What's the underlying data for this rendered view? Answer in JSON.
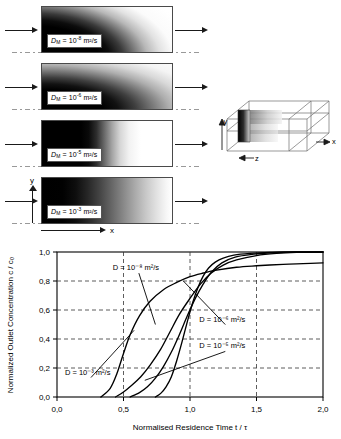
{
  "figure": {
    "panels": [
      {
        "id": "panel-d8",
        "symbol": "D",
        "subscript": "M",
        "equals": "=",
        "mantissa": "10",
        "exponent": "-8",
        "units": "m²/s",
        "label_text": "D_M = 10^-8 m²/s",
        "diffusion_coefficient": 1e-08,
        "pattern": "curved-parabolic-front"
      },
      {
        "id": "panel-d6",
        "symbol": "D",
        "subscript": "M",
        "equals": "=",
        "mantissa": "10",
        "exponent": "-6",
        "units": "m²/s",
        "label_text": "D_M = 10^-6 m²/s",
        "diffusion_coefficient": 1e-06,
        "pattern": "broad-curved-front"
      },
      {
        "id": "panel-d5",
        "symbol": "D",
        "subscript": "M",
        "equals": "=",
        "mantissa": "10",
        "exponent": "-5",
        "units": "m²/s",
        "label_text": "D_M = 10^-5 m²/s",
        "diffusion_coefficient": 1e-05,
        "pattern": "sharp-vertical-front"
      },
      {
        "id": "panel-d3",
        "symbol": "D",
        "subscript": "M",
        "equals": "=",
        "mantissa": "10",
        "exponent": "-3",
        "units": "m²/s",
        "label_text": "D_M = 10^-3 m²/s",
        "diffusion_coefficient": 0.001,
        "pattern": "smooth-linear-gradient"
      }
    ],
    "axis_labels": {
      "y": "y",
      "x": "x"
    },
    "duct": {
      "axis_x": "x",
      "axis_y": "y",
      "axis_z": "z"
    }
  },
  "chart_data": {
    "type": "line",
    "title": "",
    "xlabel": "Normalised Residence Time t / τ",
    "ylabel": "Normalized Outlet Concentration c / c₀",
    "xlim": [
      0.0,
      2.0
    ],
    "ylim": [
      0.0,
      1.0
    ],
    "xticks": [
      0.0,
      0.5,
      1.0,
      1.5,
      2.0
    ],
    "xticklabels": [
      "0,0",
      "0,5",
      "1,0",
      "1,5",
      "2,0"
    ],
    "yticks": [
      0.0,
      0.2,
      0.4,
      0.6,
      0.8,
      1.0
    ],
    "yticklabels": [
      "0,0",
      "0,2",
      "0,4",
      "0,6",
      "0,8",
      "1,0"
    ],
    "grid": "dashed-both",
    "legend": "inline-annotations",
    "series": [
      {
        "name": "D = 10^-3 m²/s",
        "annotation": "D = 10⁻³ m²/s",
        "x": [
          0.33,
          0.4,
          0.45,
          0.5,
          0.55,
          0.62,
          0.7,
          0.8,
          0.9,
          1.0,
          1.1,
          1.2,
          1.35,
          1.5,
          1.7,
          1.85,
          2.0
        ],
        "y": [
          0.0,
          0.06,
          0.16,
          0.3,
          0.43,
          0.56,
          0.66,
          0.74,
          0.79,
          0.83,
          0.855,
          0.875,
          0.895,
          0.905,
          0.915,
          0.92,
          0.925
        ]
      },
      {
        "name": "D = 10^-5 m²/s",
        "annotation": "D = 10⁻⁵ m²/s",
        "x": [
          0.44,
          0.5,
          0.56,
          0.63,
          0.7,
          0.78,
          0.85,
          0.92,
          1.0,
          1.08,
          1.16,
          1.25,
          1.35,
          1.5,
          1.65,
          1.8,
          2.0
        ],
        "y": [
          0.0,
          0.035,
          0.08,
          0.14,
          0.22,
          0.33,
          0.45,
          0.57,
          0.68,
          0.78,
          0.855,
          0.91,
          0.945,
          0.975,
          0.99,
          0.997,
          1.0
        ]
      },
      {
        "name": "D = 10^-6 m²/s",
        "annotation": "D = 10⁻⁶ m²/s",
        "x": [
          0.55,
          0.62,
          0.68,
          0.74,
          0.8,
          0.86,
          0.92,
          0.98,
          1.04,
          1.1,
          1.16,
          1.24,
          1.34,
          1.48,
          1.62,
          1.8,
          2.0
        ],
        "y": [
          0.0,
          0.03,
          0.07,
          0.13,
          0.21,
          0.31,
          0.43,
          0.56,
          0.68,
          0.78,
          0.86,
          0.925,
          0.965,
          0.985,
          0.995,
          1.0,
          1.0
        ]
      },
      {
        "name": "D = 10^-8 m²/s",
        "annotation": "D = 10⁻⁸ m²/s",
        "x": [
          0.74,
          0.78,
          0.82,
          0.86,
          0.9,
          0.94,
          0.98,
          1.02,
          1.06,
          1.1,
          1.14,
          1.19,
          1.25,
          1.33,
          1.45,
          1.6,
          1.8,
          2.0
        ],
        "y": [
          0.0,
          0.025,
          0.07,
          0.14,
          0.25,
          0.38,
          0.52,
          0.65,
          0.755,
          0.835,
          0.89,
          0.93,
          0.958,
          0.978,
          0.99,
          0.997,
          1.0,
          1.0
        ]
      }
    ],
    "annotations": [
      {
        "text": "D = 10⁻⁸ m²/s",
        "x": 0.42,
        "y": 0.875,
        "leader_to": {
          "x": 0.74,
          "y": 0.5
        }
      },
      {
        "text": "D = 10⁻⁶ m²/s",
        "x": 1.07,
        "y": 0.52,
        "leader_to": {
          "x": 0.95,
          "y": 0.8
        }
      },
      {
        "text": "D = 10⁻⁵ m²/s",
        "x": 1.07,
        "y": 0.335,
        "leader_to": {
          "x": 0.66,
          "y": 0.115
        }
      },
      {
        "text": "D = 10⁻³ m²/s",
        "x": 0.06,
        "y": 0.155,
        "leader_to": {
          "x": 0.58,
          "y": 0.46
        }
      }
    ]
  }
}
